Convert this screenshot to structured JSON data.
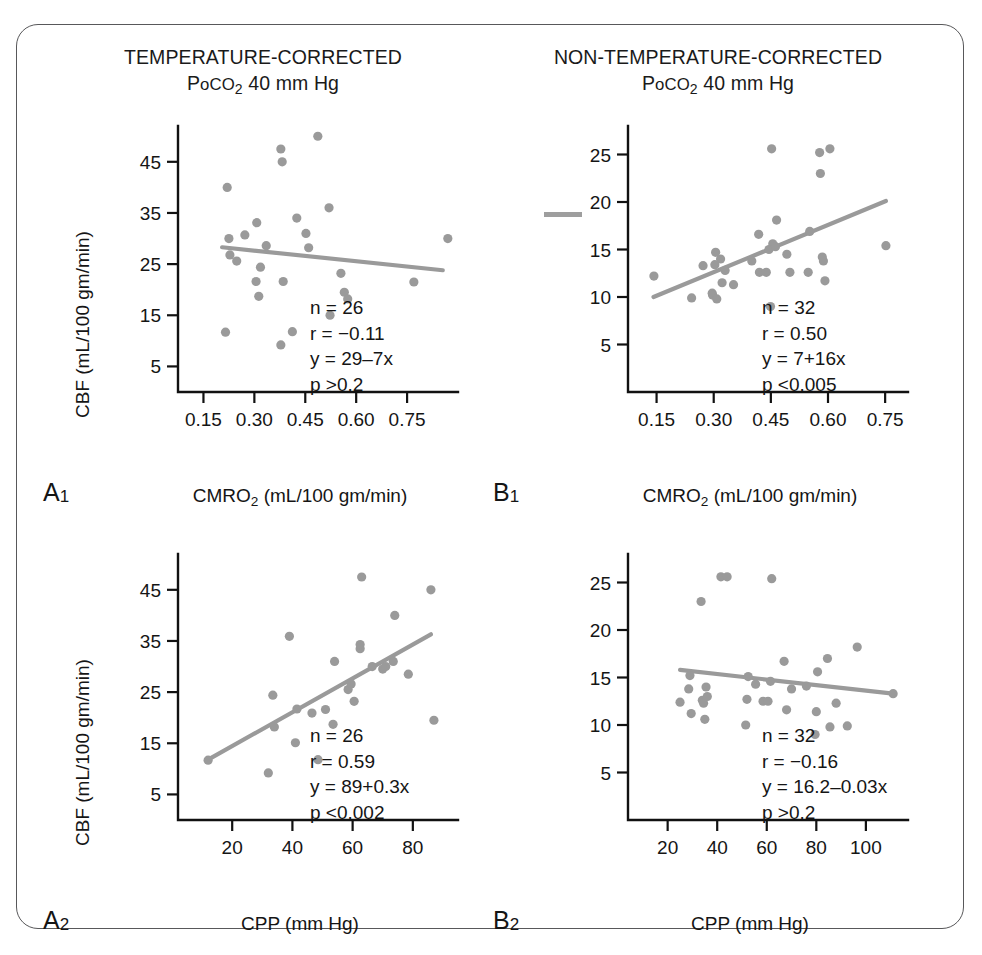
{
  "figure": {
    "background": "#ffffff",
    "border_color": "#58585a",
    "point_color": "#9a9a9a",
    "line_color": "#9a9a9a",
    "axis_color": "#111111"
  },
  "headers": {
    "left": {
      "line1": "TEMPERATURE-CORRECTED",
      "line2_pre": "P",
      "line2_small": "o",
      "line2_co": "CO",
      "line2_sub": "2",
      "line2_post": " 40 mm Hg"
    },
    "right": {
      "line1": "NON-TEMPERATURE-CORRECTED",
      "line2_pre": "P",
      "line2_small": "o",
      "line2_co": "CO",
      "line2_sub": "2",
      "line2_post": " 40 mm Hg"
    }
  },
  "panels": {
    "A1": {
      "id": "A",
      "id_sub": "1",
      "ylabel_pre": "CBF (mL/100 gm/min)",
      "xlabel_pre": "CMRO",
      "xlabel_sub": "2",
      "xlabel_post": " (mL/100 gm/min)",
      "stats": {
        "n": "n = 26",
        "r": "r = −0.11",
        "y": "y = 29–7x",
        "p": "p >0.2"
      }
    },
    "A2": {
      "id": "A",
      "id_sub": "2",
      "ylabel_pre": "CBF (mL/100 gm/min)",
      "xlabel_pre": "CPP (mm Hg)",
      "xlabel_sub": "",
      "xlabel_post": "",
      "stats": {
        "n": "n = 26",
        "r": "r = 0.59",
        "y": "y = 89+0.3x",
        "p": "p <0.002"
      }
    },
    "B1": {
      "id": "B",
      "id_sub": "1",
      "ylabel_pre": "",
      "xlabel_pre": "CMRO",
      "xlabel_sub": "2",
      "xlabel_post": " (mL/100 gm/min)",
      "stats": {
        "n": "n = 32",
        "r": "r = 0.50",
        "y": "y = 7+16x",
        "p": "p <0.005"
      }
    },
    "B2": {
      "id": "B",
      "id_sub": "2",
      "ylabel_pre": "",
      "xlabel_pre": "CPP (mm Hg)",
      "xlabel_sub": "",
      "xlabel_post": "",
      "stats": {
        "n": "n = 32",
        "r": "r = −0.16",
        "y": "y = 16.2–0.03x",
        "p": "p >0.2"
      }
    }
  },
  "chart_data": [
    {
      "key": "A1",
      "type": "scatter",
      "title": "TEMPERATURE-CORRECTED PoCO2 40 mm Hg",
      "panel_label": "A1",
      "xlabel": "CMRO2 (mL/100 gm/min)",
      "ylabel": "CBF (mL/100 gm/min)",
      "xlim": [
        0.075,
        0.9
      ],
      "ylim": [
        0,
        52
      ],
      "xticks": [
        0.15,
        0.3,
        0.45,
        0.6,
        0.75
      ],
      "xticklabels": [
        "0.15",
        "0.30",
        "0.45",
        "0.60",
        "0.75"
      ],
      "yticks": [
        5,
        15,
        25,
        35,
        45
      ],
      "yticklabels": [
        "5",
        "15",
        "25",
        "35",
        "45"
      ],
      "grid": false,
      "legend": "none",
      "n": 26,
      "r": -0.11,
      "fit": "y = 29-7x",
      "p": "p >0.2",
      "fit_line": {
        "x0": 0.205,
        "y0": 28.3,
        "x1": 0.855,
        "y1": 23.8
      },
      "points": [
        [
          0.215,
          11.7
        ],
        [
          0.22,
          40.0
        ],
        [
          0.225,
          30.0
        ],
        [
          0.228,
          26.8
        ],
        [
          0.248,
          25.6
        ],
        [
          0.272,
          30.7
        ],
        [
          0.307,
          33.1
        ],
        [
          0.305,
          21.6
        ],
        [
          0.313,
          18.7
        ],
        [
          0.318,
          24.4
        ],
        [
          0.335,
          28.6
        ],
        [
          0.378,
          9.2
        ],
        [
          0.382,
          45.0
        ],
        [
          0.378,
          47.5
        ],
        [
          0.385,
          21.6
        ],
        [
          0.412,
          11.8
        ],
        [
          0.425,
          34.0
        ],
        [
          0.452,
          31.0
        ],
        [
          0.46,
          28.2
        ],
        [
          0.487,
          50.0
        ],
        [
          0.52,
          36.0
        ],
        [
          0.523,
          15.0
        ],
        [
          0.555,
          23.2
        ],
        [
          0.565,
          19.5
        ],
        [
          0.575,
          18.2
        ],
        [
          0.77,
          21.5
        ],
        [
          0.87,
          30.0
        ]
      ]
    },
    {
      "key": "B1",
      "type": "scatter",
      "title": "NON-TEMPERATURE-CORRECTED PoCO2 40 mm Hg",
      "panel_label": "B1",
      "xlabel": "CMRO2 (mL/100 gm/min)",
      "ylabel": "",
      "xlim": [
        0.075,
        0.81
      ],
      "ylim": [
        0,
        28
      ],
      "xticks": [
        0.15,
        0.3,
        0.45,
        0.6,
        0.75
      ],
      "xticklabels": [
        "0.15",
        "0.30",
        "0.45",
        "0.60",
        "0.75"
      ],
      "yticks": [
        5,
        10,
        15,
        20,
        25
      ],
      "yticklabels": [
        "5",
        "10",
        "15",
        "20",
        "25"
      ],
      "grid": false,
      "legend": "none",
      "n": 32,
      "r": 0.5,
      "fit": "y = 7+16x",
      "p": "p <0.005",
      "fit_line": {
        "x0": 0.142,
        "y0": 10.0,
        "x1": 0.752,
        "y1": 20.1
      },
      "points": [
        [
          0.143,
          12.2
        ],
        [
          0.242,
          9.9
        ],
        [
          0.272,
          13.3
        ],
        [
          0.296,
          10.4
        ],
        [
          0.297,
          10.2
        ],
        [
          0.303,
          13.4
        ],
        [
          0.305,
          14.7
        ],
        [
          0.308,
          9.8
        ],
        [
          0.318,
          14.0
        ],
        [
          0.322,
          11.5
        ],
        [
          0.33,
          12.8
        ],
        [
          0.352,
          11.3
        ],
        [
          0.4,
          13.8
        ],
        [
          0.418,
          16.6
        ],
        [
          0.42,
          12.6
        ],
        [
          0.438,
          12.6
        ],
        [
          0.445,
          15.0
        ],
        [
          0.449,
          9.0
        ],
        [
          0.452,
          25.6
        ],
        [
          0.455,
          15.6
        ],
        [
          0.462,
          15.3
        ],
        [
          0.465,
          18.1
        ],
        [
          0.492,
          14.5
        ],
        [
          0.5,
          12.6
        ],
        [
          0.548,
          12.6
        ],
        [
          0.552,
          16.9
        ],
        [
          0.578,
          25.2
        ],
        [
          0.58,
          23.0
        ],
        [
          0.585,
          14.2
        ],
        [
          0.588,
          13.8
        ],
        [
          0.592,
          11.7
        ],
        [
          0.605,
          25.6
        ],
        [
          0.752,
          15.4
        ]
      ]
    },
    {
      "key": "A2",
      "type": "scatter",
      "title": "TEMPERATURE-CORRECTED PoCO2 40 mm Hg",
      "panel_label": "A2",
      "xlabel": "CPP (mm Hg)",
      "ylabel": "CBF (mL/100 gm/min)",
      "xlim": [
        2,
        95
      ],
      "ylim": [
        0,
        52
      ],
      "xticks": [
        20,
        40,
        60,
        80
      ],
      "xticklabels": [
        "20",
        "40",
        "60",
        "80"
      ],
      "yticks": [
        5,
        15,
        25,
        35,
        45
      ],
      "yticklabels": [
        "5",
        "15",
        "25",
        "35",
        "45"
      ],
      "grid": false,
      "legend": "none",
      "n": 26,
      "r": 0.59,
      "fit": "y = 89+0.3x",
      "p": "p <0.002",
      "fit_line": {
        "x0": 12.0,
        "y0": 11.8,
        "x1": 86.0,
        "y1": 36.3
      },
      "points": [
        [
          12.0,
          11.7
        ],
        [
          32.0,
          9.2
        ],
        [
          33.5,
          24.4
        ],
        [
          34.0,
          18.2
        ],
        [
          39.0,
          35.9
        ],
        [
          41.0,
          15.1
        ],
        [
          41.5,
          21.7
        ],
        [
          46.5,
          20.9
        ],
        [
          48.5,
          11.8
        ],
        [
          51.0,
          21.6
        ],
        [
          53.5,
          18.7
        ],
        [
          54.0,
          31.0
        ],
        [
          58.5,
          25.5
        ],
        [
          59.5,
          26.6
        ],
        [
          60.5,
          23.2
        ],
        [
          62.5,
          33.5
        ],
        [
          62.5,
          34.3
        ],
        [
          63.0,
          47.5
        ],
        [
          66.5,
          30.0
        ],
        [
          70.0,
          29.5
        ],
        [
          71.0,
          30.0
        ],
        [
          73.5,
          31.0
        ],
        [
          74.0,
          40.0
        ],
        [
          78.5,
          28.5
        ],
        [
          86.0,
          45.0
        ],
        [
          87.0,
          19.5
        ]
      ]
    },
    {
      "key": "B2",
      "type": "scatter",
      "title": "NON-TEMPERATURE-CORRECTED PoCO2 40 mm Hg",
      "panel_label": "B2",
      "xlabel": "CPP (mm Hg)",
      "ylabel": "",
      "xlim": [
        4,
        117
      ],
      "ylim": [
        0,
        28
      ],
      "xticks": [
        20,
        40,
        60,
        80,
        100
      ],
      "xticklabels": [
        "20",
        "40",
        "60",
        "80",
        "100"
      ],
      "yticks": [
        5,
        10,
        15,
        20,
        25
      ],
      "yticklabels": [
        "5",
        "10",
        "15",
        "20",
        "25"
      ],
      "grid": false,
      "legend": "none",
      "n": 32,
      "r": -0.16,
      "fit": "y = 16.2-0.03x",
      "p": "p >0.2",
      "fit_line": {
        "x0": 25.0,
        "y0": 15.8,
        "x1": 111.0,
        "y1": 13.3
      },
      "points": [
        [
          25.0,
          12.4
        ],
        [
          28.5,
          13.8
        ],
        [
          29.0,
          15.2
        ],
        [
          29.5,
          11.2
        ],
        [
          33.5,
          23.0
        ],
        [
          34.0,
          12.6
        ],
        [
          34.5,
          12.3
        ],
        [
          35.0,
          10.6
        ],
        [
          35.5,
          14.0
        ],
        [
          36.0,
          13.0
        ],
        [
          41.5,
          25.6
        ],
        [
          44.0,
          25.6
        ],
        [
          51.5,
          10.0
        ],
        [
          52.0,
          12.7
        ],
        [
          52.5,
          15.1
        ],
        [
          55.5,
          14.3
        ],
        [
          58.5,
          12.5
        ],
        [
          60.5,
          12.5
        ],
        [
          61.5,
          14.6
        ],
        [
          62.0,
          25.4
        ],
        [
          67.0,
          16.7
        ],
        [
          68.0,
          11.6
        ],
        [
          70.0,
          13.8
        ],
        [
          76.0,
          14.1
        ],
        [
          79.5,
          9.0
        ],
        [
          80.0,
          11.4
        ],
        [
          80.5,
          15.6
        ],
        [
          84.5,
          17.0
        ],
        [
          85.5,
          9.8
        ],
        [
          88.0,
          12.3
        ],
        [
          92.5,
          9.9
        ],
        [
          96.5,
          18.2
        ],
        [
          111.0,
          13.3
        ]
      ]
    }
  ]
}
